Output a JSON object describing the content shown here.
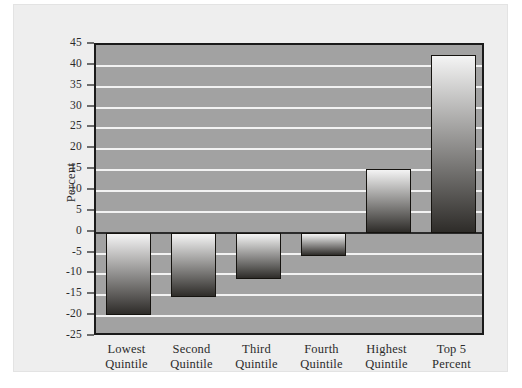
{
  "chart_data": {
    "type": "bar",
    "title": "",
    "subtitle": "",
    "xlabel": "",
    "ylabel": "Percent",
    "categories": [
      "Lowest Quintile",
      "Second Quintile",
      "Third Quintile",
      "Fourth Quintile",
      "Highest Quintile",
      "Top 5 Percent"
    ],
    "category_lines": [
      [
        "Lowest",
        "Quintile"
      ],
      [
        "Second",
        "Quintile"
      ],
      [
        "Third",
        "Quintile"
      ],
      [
        "Fourth",
        "Quintile"
      ],
      [
        "Highest",
        "Quintile"
      ],
      [
        "Top 5",
        "Percent"
      ]
    ],
    "values": [
      -19.7,
      -15.5,
      -11.0,
      -5.5,
      15.3,
      42.7
    ],
    "ylim": [
      -25,
      45
    ],
    "ytick_step": 5,
    "yticks": [
      45,
      40,
      35,
      30,
      25,
      20,
      15,
      10,
      5,
      0,
      -5,
      -10,
      -15,
      -20,
      -25
    ],
    "ytick_labels": [
      "45",
      "40",
      "35",
      "30",
      "25",
      "20",
      "15",
      "10",
      "5",
      "0",
      "-5",
      "-10",
      "-15",
      "-20",
      "-25"
    ],
    "grid": true,
    "gridline_color": "#f2f2f2",
    "zeroline_value": 0,
    "legend": [],
    "legend_position": "none",
    "annotations": [],
    "plot_background": "#a2a2a2",
    "bar_gradient_top": "#f4f4f4",
    "bar_gradient_bottom": "#2e2c29",
    "bar_outline": "#15130f",
    "figure_background": "#eeeeee",
    "axis_color": "#1a1a1a",
    "text_color": "#2b2b2b"
  }
}
